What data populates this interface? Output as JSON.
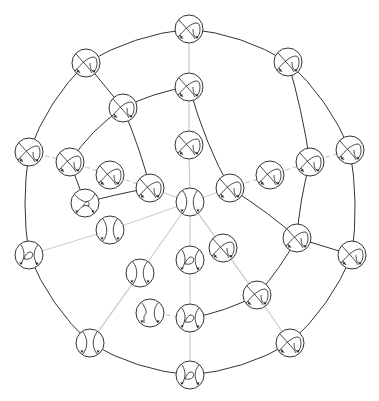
{
  "diagram": {
    "type": "graph",
    "node_radius": 14,
    "colors": {
      "dark_edge": "#333333",
      "light_edge": "#cfcfcf",
      "node_stroke": "#333333",
      "background": "#ffffff"
    },
    "nodes": [
      {
        "id": "n1",
        "x": 189,
        "y": 29,
        "glyph": "crossing-loop"
      },
      {
        "id": "n2",
        "x": 86,
        "y": 63,
        "glyph": "crossing-loop"
      },
      {
        "id": "n3",
        "x": 288,
        "y": 62,
        "glyph": "crossing-loop"
      },
      {
        "id": "n4",
        "x": 189,
        "y": 87,
        "glyph": "crossing-loop"
      },
      {
        "id": "n5",
        "x": 123,
        "y": 108,
        "glyph": "crossing-loop"
      },
      {
        "id": "n6",
        "x": 189,
        "y": 145,
        "glyph": "crossing-loop"
      },
      {
        "id": "n7",
        "x": 29,
        "y": 152,
        "glyph": "crossing-loop"
      },
      {
        "id": "n8",
        "x": 70,
        "y": 162,
        "glyph": "crossing-loop"
      },
      {
        "id": "n9",
        "x": 110,
        "y": 175,
        "glyph": "crossing-loop"
      },
      {
        "id": "n10",
        "x": 150,
        "y": 188,
        "glyph": "crossing-loop"
      },
      {
        "id": "n11",
        "x": 230,
        "y": 188,
        "glyph": "crossing-loop"
      },
      {
        "id": "n12",
        "x": 270,
        "y": 175,
        "glyph": "crossing-loop"
      },
      {
        "id": "n13",
        "x": 310,
        "y": 162,
        "glyph": "crossing-loop"
      },
      {
        "id": "n14",
        "x": 350,
        "y": 150,
        "glyph": "crossing-loop"
      },
      {
        "id": "n15",
        "x": 85,
        "y": 203,
        "glyph": "twist"
      },
      {
        "id": "n16",
        "x": 190,
        "y": 202,
        "glyph": "parallel"
      },
      {
        "id": "n17",
        "x": 110,
        "y": 230,
        "glyph": "parallel"
      },
      {
        "id": "n18",
        "x": 29,
        "y": 255,
        "glyph": "kink"
      },
      {
        "id": "n19",
        "x": 223,
        "y": 248,
        "glyph": "crossing-loop"
      },
      {
        "id": "n20",
        "x": 190,
        "y": 260,
        "glyph": "kink"
      },
      {
        "id": "n21",
        "x": 297,
        "y": 238,
        "glyph": "crossing-loop"
      },
      {
        "id": "n22",
        "x": 352,
        "y": 255,
        "glyph": "crossing-loop"
      },
      {
        "id": "n23",
        "x": 140,
        "y": 273,
        "glyph": "parallel"
      },
      {
        "id": "n24",
        "x": 257,
        "y": 295,
        "glyph": "crossing-loop"
      },
      {
        "id": "n25",
        "x": 150,
        "y": 313,
        "glyph": "bent"
      },
      {
        "id": "n26",
        "x": 190,
        "y": 318,
        "glyph": "kink"
      },
      {
        "id": "n27",
        "x": 290,
        "y": 343,
        "glyph": "crossing-loop"
      },
      {
        "id": "n28",
        "x": 90,
        "y": 343,
        "glyph": "parallel"
      },
      {
        "id": "n29",
        "x": 190,
        "y": 375,
        "glyph": "kink"
      }
    ],
    "edges": [
      {
        "from": "n1",
        "to": "n2",
        "style": "dark",
        "curve": 12
      },
      {
        "from": "n2",
        "to": "n7",
        "style": "dark",
        "curve": 12
      },
      {
        "from": "n7",
        "to": "n18",
        "style": "dark",
        "curve": 8
      },
      {
        "from": "n18",
        "to": "n28",
        "style": "dark",
        "curve": 12
      },
      {
        "from": "n28",
        "to": "n29",
        "style": "dark",
        "curve": 12
      },
      {
        "from": "n29",
        "to": "n27",
        "style": "dark",
        "curve": 12
      },
      {
        "from": "n27",
        "to": "n22",
        "style": "dark",
        "curve": 12
      },
      {
        "from": "n22",
        "to": "n14",
        "style": "dark",
        "curve": 8
      },
      {
        "from": "n14",
        "to": "n3",
        "style": "dark",
        "curve": 12
      },
      {
        "from": "n3",
        "to": "n1",
        "style": "dark",
        "curve": 12
      },
      {
        "from": "n1",
        "to": "n4",
        "style": "light",
        "curve": 0
      },
      {
        "from": "n2",
        "to": "n5",
        "style": "dark",
        "curve": 0
      },
      {
        "from": "n3",
        "to": "n13",
        "style": "dark",
        "curve": 4
      },
      {
        "from": "n5",
        "to": "n4",
        "style": "dark",
        "curve": 6
      },
      {
        "from": "n5",
        "to": "n8",
        "style": "dark",
        "curve": 8
      },
      {
        "from": "n5",
        "to": "n10",
        "style": "dark",
        "curve": -8
      },
      {
        "from": "n4",
        "to": "n11",
        "style": "dark",
        "curve": -10
      },
      {
        "from": "n4",
        "to": "n6",
        "style": "light",
        "curve": 0
      },
      {
        "from": "n6",
        "to": "n16",
        "style": "light",
        "curve": 0
      },
      {
        "from": "n7",
        "to": "n8",
        "style": "dashed",
        "curve": 0
      },
      {
        "from": "n8",
        "to": "n9",
        "style": "dashed",
        "curve": 0
      },
      {
        "from": "n9",
        "to": "n10",
        "style": "dashed",
        "curve": 0
      },
      {
        "from": "n8",
        "to": "n15",
        "style": "dark",
        "curve": 0
      },
      {
        "from": "n15",
        "to": "n10",
        "style": "dark",
        "curve": 6
      },
      {
        "from": "n10",
        "to": "n16",
        "style": "light",
        "curve": 0
      },
      {
        "from": "n16",
        "to": "n11",
        "style": "light",
        "curve": 0
      },
      {
        "from": "n11",
        "to": "n12",
        "style": "dashed",
        "curve": 0
      },
      {
        "from": "n12",
        "to": "n13",
        "style": "dashed",
        "curve": 0
      },
      {
        "from": "n13",
        "to": "n14",
        "style": "dashed",
        "curve": 0
      },
      {
        "from": "n11",
        "to": "n21",
        "style": "dark",
        "curve": 8
      },
      {
        "from": "n13",
        "to": "n21",
        "style": "dark",
        "curve": -4
      },
      {
        "from": "n21",
        "to": "n22",
        "style": "dark",
        "curve": 0
      },
      {
        "from": "n18",
        "to": "n17",
        "style": "light",
        "curve": 0
      },
      {
        "from": "n17",
        "to": "n16",
        "style": "light",
        "curve": 0
      },
      {
        "from": "n16",
        "to": "n23",
        "style": "light",
        "curve": 0
      },
      {
        "from": "n16",
        "to": "n20",
        "style": "light",
        "curve": 0
      },
      {
        "from": "n16",
        "to": "n19",
        "style": "light",
        "curve": 0
      },
      {
        "from": "n23",
        "to": "n28",
        "style": "light",
        "curve": 0
      },
      {
        "from": "n19",
        "to": "n24",
        "style": "light",
        "curve": 0
      },
      {
        "from": "n21",
        "to": "n24",
        "style": "dark",
        "curve": 4
      },
      {
        "from": "n24",
        "to": "n26",
        "style": "dark",
        "curve": 6
      },
      {
        "from": "n24",
        "to": "n27",
        "style": "light",
        "curve": 0
      },
      {
        "from": "n20",
        "to": "n26",
        "style": "light",
        "curve": 0
      },
      {
        "from": "n25",
        "to": "n26",
        "style": "dashed",
        "curve": 0
      },
      {
        "from": "n26",
        "to": "n29",
        "style": "light",
        "curve": 0
      }
    ]
  }
}
